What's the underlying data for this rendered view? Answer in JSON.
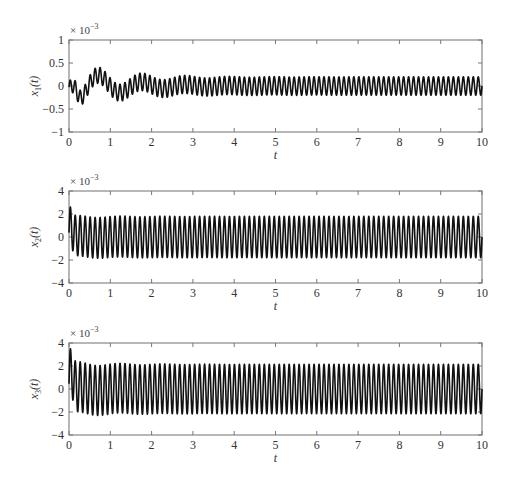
{
  "chart_data": [
    {
      "type": "line",
      "title": "",
      "xlabel": "t",
      "ylabel": "x1(t)",
      "ylabel_main": "x",
      "ylabel_sub": "1",
      "ylabel_tail": "(t)",
      "scale_note": "× 10",
      "scale_exp": "−3",
      "xlim": [
        0,
        10
      ],
      "ylim": [
        -1,
        1
      ],
      "xticks": [
        0,
        1,
        2,
        3,
        4,
        5,
        6,
        7,
        8,
        9,
        10
      ],
      "yticks": [
        -1,
        -0.5,
        0,
        0.5,
        1
      ],
      "ytick_labels": [
        "−1",
        "−0.5",
        "0",
        "0.5",
        "1"
      ],
      "grid": false,
      "legend": null,
      "series": [
        {
          "name": "x1",
          "description": "Damped low-frequency transient plus sustained high-frequency oscillation; initial peak ≈0.6e-3, min ≈-0.6e-3 near t=0.5, steady-state amplitude ≈±0.2e-3",
          "hf_freq": 8.3,
          "hf_amp_steady": 0.2,
          "hf_amp_initial": 0.15,
          "lf_freq": 0.95,
          "lf_amp": 0.45,
          "lf_decay": 1.1,
          "lf_phase": 0.35,
          "peaks": [
            [
              0.1,
              0.6
            ],
            [
              0.5,
              -0.6
            ],
            [
              1.1,
              0.42
            ],
            [
              1.7,
              -0.35
            ],
            [
              2.2,
              0.3
            ],
            [
              10,
              0.2
            ]
          ]
        }
      ]
    },
    {
      "type": "line",
      "title": "",
      "xlabel": "t",
      "ylabel": "x2(t)",
      "ylabel_main": "x",
      "ylabel_sub": "2",
      "ylabel_tail": "(t)",
      "scale_note": "× 10",
      "scale_exp": "−3",
      "xlim": [
        0,
        10
      ],
      "ylim": [
        -4,
        4
      ],
      "xticks": [
        0,
        1,
        2,
        3,
        4,
        5,
        6,
        7,
        8,
        9,
        10
      ],
      "yticks": [
        -4,
        -2,
        0,
        2,
        4
      ],
      "ytick_labels": [
        "−4",
        "−2",
        "0",
        "2",
        "4"
      ],
      "grid": false,
      "legend": null,
      "series": [
        {
          "name": "x2",
          "description": "High-frequency oscillation, initial spike ≈2.4e-3, amplitude ≈±1.8e-3 steady",
          "hf_freq": 8.3,
          "hf_amp_steady": 1.8,
          "hf_amp_initial": 1.75,
          "lf_freq": 0.95,
          "lf_amp": 0.15,
          "lf_decay": 1.1,
          "lf_phase": 0.35,
          "peaks": [
            [
              0.08,
              2.4
            ],
            [
              0.6,
              -2.1
            ],
            [
              1.1,
              2.0
            ],
            [
              10,
              1.8
            ]
          ]
        }
      ]
    },
    {
      "type": "line",
      "title": "",
      "xlabel": "t",
      "ylabel": "x3(t)",
      "ylabel_main": "x",
      "ylabel_sub": "3",
      "ylabel_tail": "(t)",
      "scale_note": "× 10",
      "scale_exp": "−3",
      "xlim": [
        0,
        10
      ],
      "ylim": [
        -4,
        4
      ],
      "xticks": [
        0,
        1,
        2,
        3,
        4,
        5,
        6,
        7,
        8,
        9,
        10
      ],
      "yticks": [
        -4,
        -2,
        0,
        2,
        4
      ],
      "ytick_labels": [
        "−4",
        "−2",
        "0",
        "2",
        "4"
      ],
      "grid": false,
      "legend": null,
      "series": [
        {
          "name": "x3",
          "description": "High-frequency oscillation, initial spike ≈3.4e-3, amplitude ≈±2.2e-3 steady",
          "hf_freq": 8.3,
          "hf_amp_steady": 2.15,
          "hf_amp_initial": 2.2,
          "lf_freq": 0.95,
          "lf_amp": 0.25,
          "lf_decay": 1.1,
          "lf_phase": 0.35,
          "peaks": [
            [
              0.08,
              3.4
            ],
            [
              0.6,
              -2.5
            ],
            [
              1.1,
              2.5
            ],
            [
              10,
              2.2
            ]
          ]
        }
      ]
    }
  ],
  "layout": {
    "axes_left": 69,
    "axes_right": 482,
    "panels": [
      {
        "top": 40,
        "bottom": 132
      },
      {
        "top": 191,
        "bottom": 283
      },
      {
        "top": 343,
        "bottom": 435
      }
    ]
  }
}
